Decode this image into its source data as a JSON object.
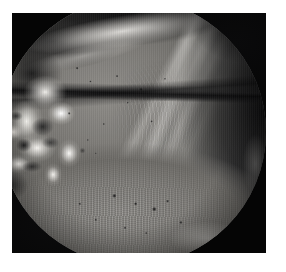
{
  "image": {
    "kind": "arthroscopic-photograph",
    "modality": "arthroscopy",
    "field_of_view": "circular",
    "border": {
      "outer_matte_color": "#ffffff",
      "plate_color": "#040404",
      "plate_left": 12,
      "plate_top": 13,
      "plate_width": 254,
      "plate_height": 240
    },
    "palette": {
      "background_white": "#ffffff",
      "frame_black": "#040404",
      "shadow_black": "#0a0a0b",
      "tissue_mid_grey": "#7c7a76",
      "tissue_light_grey": "#8f8d89",
      "tissue_dark_grey": "#3a3a39",
      "specular_white": "#f2f0ec",
      "highlight_white": "#ffffff"
    },
    "regions": [
      {
        "name": "articular-cartilage-dome",
        "description": "large smooth grey convex cartilage-covered surface occupying the centre and upper-left of the field",
        "tone": "mid grey",
        "position": "centre-upper-left"
      },
      {
        "name": "flocculent-white-tissue",
        "description": "bright irregular white frond-like fibrillated tissue with dark clefts",
        "tone": "near white",
        "position": "left margin, mid height"
      },
      {
        "name": "fibrous-bands",
        "description": "parallel diagonal fibrous ligamentous striations running from upper-right toward lower-centre",
        "tone": "light grey on dark",
        "position": "upper-right quadrant"
      },
      {
        "name": "dark-gutter",
        "description": "deep shadowed recess with minimal illumination",
        "tone": "near black",
        "position": "right margin and superior margin"
      },
      {
        "name": "joint-line",
        "description": "dark horizontal boundary separating the upper cartilage surface from the lower tissue field",
        "tone": "black line",
        "position": "horizontal, lower third"
      },
      {
        "name": "granular-lower-field",
        "description": "coarse granular fibrillated tissue surface with scattered dark pits",
        "tone": "light to mid grey",
        "position": "lower half"
      },
      {
        "name": "vignette",
        "description": "circular endoscopic vignette fading to black at the rim",
        "tone": "black",
        "position": "perimeter"
      }
    ],
    "artifacts": [
      "interlaced video scanlines",
      "specular highlight arc along superior cartilage margin",
      "rim glint at lower-right of the circular aperture"
    ]
  }
}
